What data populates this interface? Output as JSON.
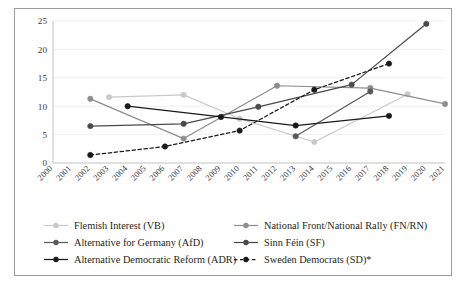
{
  "figure": {
    "background": "#ffffff",
    "border_color": "#9b9b9b",
    "footnote_marker": "*"
  },
  "chart_data": {
    "type": "line",
    "title": "",
    "subtitle": "",
    "xlabel": "",
    "ylabel": "",
    "grid": "horizontal",
    "legend_position": "bottom",
    "xlim": [
      2000,
      2021
    ],
    "ylim": [
      0,
      25
    ],
    "yticks": [
      0,
      5,
      10,
      15,
      20,
      25
    ],
    "ytick_labels": [
      "0",
      "5",
      "10",
      "15",
      "20",
      "25"
    ],
    "x": [
      2000,
      2001,
      2002,
      2003,
      2004,
      2005,
      2006,
      2007,
      2008,
      2009,
      2010,
      2011,
      2012,
      2013,
      2014,
      2015,
      2016,
      2017,
      2018,
      2019,
      2020,
      2021
    ],
    "xtick_labels": [
      "2000",
      "2001",
      "2002",
      "2003",
      "2004",
      "2005",
      "2006",
      "2007",
      "2008",
      "2009",
      "2010",
      "2011",
      "2012",
      "2013",
      "2014",
      "2015",
      "2016",
      "2017",
      "2018",
      "2019",
      "2020",
      "2021"
    ],
    "series": [
      {
        "name": "Flemish Interest (VB)",
        "color": "#c9c9c9",
        "dash": "solid",
        "marker": "circle",
        "points": [
          {
            "x": 2003,
            "y": 11.6
          },
          {
            "x": 2007,
            "y": 12.0
          },
          {
            "x": 2010,
            "y": 7.8
          },
          {
            "x": 2014,
            "y": 3.7
          },
          {
            "x": 2019,
            "y": 12.1
          }
        ]
      },
      {
        "name": "National Front/National Rally (FN/RN)",
        "color": "#8e8e8e",
        "dash": "solid",
        "marker": "circle",
        "points": [
          {
            "x": 2002,
            "y": 11.3
          },
          {
            "x": 2007,
            "y": 4.3
          },
          {
            "x": 2012,
            "y": 13.6
          },
          {
            "x": 2017,
            "y": 13.2
          },
          {
            "x": 2021,
            "y": 10.4
          }
        ]
      },
      {
        "name": "Alternative for Germany (AfD)",
        "color": "#5a5a5a",
        "dash": "solid",
        "marker": "circle",
        "points": [
          {
            "x": 2013,
            "y": 4.7
          },
          {
            "x": 2017,
            "y": 12.6
          }
        ]
      },
      {
        "name": "Sinn Féin (SF)",
        "color": "#4a4a4a",
        "dash": "solid",
        "marker": "circle",
        "points": [
          {
            "x": 2002,
            "y": 6.5
          },
          {
            "x": 2007,
            "y": 6.9
          },
          {
            "x": 2011,
            "y": 9.9
          },
          {
            "x": 2016,
            "y": 13.8
          },
          {
            "x": 2020,
            "y": 24.5
          }
        ]
      },
      {
        "name": "Alternative Democratic Reform (ADR)",
        "color": "#1a1a1a",
        "dash": "solid",
        "marker": "circle",
        "points": [
          {
            "x": 2004,
            "y": 10.0
          },
          {
            "x": 2009,
            "y": 8.1
          },
          {
            "x": 2013,
            "y": 6.6
          },
          {
            "x": 2018,
            "y": 8.3
          }
        ]
      },
      {
        "name": "Sweden Democrats (SD)*",
        "color": "#1a1a1a",
        "dash": "dashed",
        "marker": "circle",
        "points": [
          {
            "x": 2002,
            "y": 1.4
          },
          {
            "x": 2006,
            "y": 2.9
          },
          {
            "x": 2010,
            "y": 5.7
          },
          {
            "x": 2014,
            "y": 12.9
          },
          {
            "x": 2018,
            "y": 17.5
          }
        ]
      }
    ]
  },
  "legend": {
    "rows": [
      {
        "left": "Flemish Interest (VB)",
        "right": "National Front/National Rally (FN/RN)"
      },
      {
        "left": "Alternative for Germany (AfD)",
        "right": "Sinn Féin (SF)"
      },
      {
        "left": "Alternative Democratic Reform (ADR)",
        "right": "Sweden Democrats (SD)*"
      }
    ]
  }
}
